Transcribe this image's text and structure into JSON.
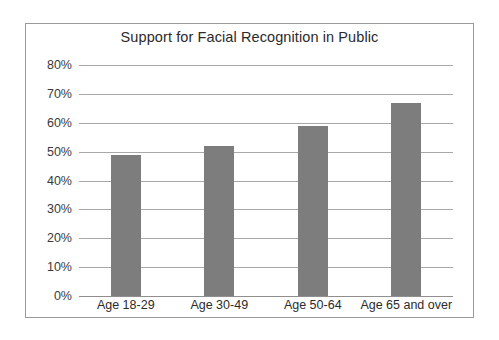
{
  "chart_data": {
    "type": "bar",
    "title": "Support for Facial Recognition in Public",
    "xlabel": "",
    "ylabel": "",
    "categories": [
      "Age 18-29",
      "Age 30-49",
      "Age 50-64",
      "Age 65 and over"
    ],
    "values": [
      49,
      52,
      59,
      67
    ],
    "value_labels": [
      "49%",
      "52%",
      "59%",
      "67%"
    ],
    "ylim": [
      0,
      80
    ],
    "ytick_labels": [
      "0%",
      "10%",
      "20%",
      "30%",
      "40%",
      "50%",
      "60%",
      "70%",
      "80%"
    ],
    "ytick_values": [
      0,
      10,
      20,
      30,
      40,
      50,
      60,
      70,
      80
    ],
    "grid": true,
    "legend": null,
    "series": [
      {
        "name": "Support",
        "values": [
          49,
          52,
          59,
          67
        ]
      }
    ],
    "colors": {
      "bar_fill": "#7d7d7d",
      "gridline": "#a8a8a8",
      "axis": "#8f8f8f",
      "border": "#9a9a9a",
      "background": "#ffffff",
      "text": "#2b2b2b"
    }
  }
}
